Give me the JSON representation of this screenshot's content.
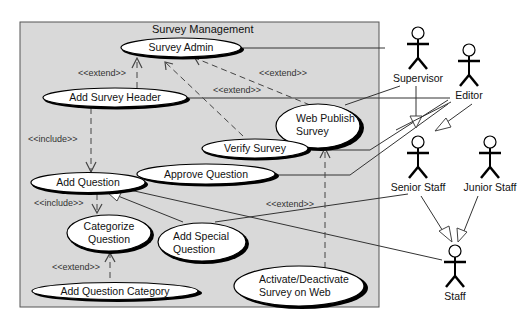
{
  "system": {
    "title": "Survey Management",
    "background": "#d9d9d9"
  },
  "use_cases": {
    "survey_admin": "Survey Admin",
    "add_survey_header": "Add Survey Header",
    "web_publish_survey": [
      "Web Publish",
      "Survey"
    ],
    "verify_survey": "Verify Survey",
    "approve_question": "Approve Question",
    "add_question": "Add Question",
    "categorize_question": [
      "Categorize",
      "Question"
    ],
    "add_special_question": [
      "Add Special",
      "Question"
    ],
    "add_question_category": "Add Question Category",
    "activate_deactivate": [
      "Activate/Deactivate",
      "Survey on Web"
    ]
  },
  "actors": {
    "supervisor": "Supervisor",
    "editor": "Editor",
    "senior_staff": "Senior Staff",
    "junior_staff": "Junior Staff",
    "staff": "Staff"
  },
  "stereotypes": {
    "extend_header": "<<extend>>",
    "include_header": "<<include>>",
    "extend_web_publish": "<<extend>>",
    "extend_verify": "<<extend>>",
    "include_add_question": "<<include>>",
    "extend_category": "<<extend>>",
    "extend_activate": "<<extend>>"
  }
}
